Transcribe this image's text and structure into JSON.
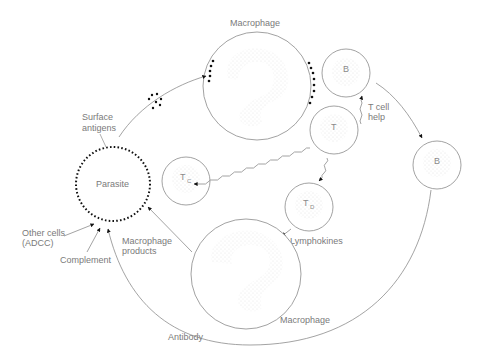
{
  "diagram": {
    "colors": {
      "line": "#8c8c8c",
      "cell_outline": "#8a8a8a",
      "cell_fill": "#f3f3f3",
      "antigen": "#111111",
      "text": "#7a7a7a",
      "background": "#ffffff"
    },
    "nodes": {
      "parasite": {
        "label": "Parasite"
      },
      "macrophage_top": {
        "label": "Macrophage"
      },
      "macrophage_bottom": {
        "label": "Macrophage"
      },
      "b_cell_small": {
        "label": "B"
      },
      "b_cell_right": {
        "label": "B"
      },
      "t_cell": {
        "label": "T"
      },
      "tc_cell": {
        "label": "T",
        "subscript": "C"
      },
      "td_cell": {
        "label": "T",
        "subscript": "D"
      }
    },
    "labels": {
      "surface_antigens_line1": "Surface",
      "surface_antigens_line2": "antigens",
      "t_cell_help_line1": "T cell",
      "t_cell_help_line2": "help",
      "lymphokines": "Lymphokines",
      "macrophage_products_line1": "Macrophage",
      "macrophage_products_line2": "products",
      "other_cells_line1": "Other cells",
      "other_cells_line2": "(ADCC)",
      "complement": "Complement",
      "antibody": "Antibody"
    },
    "edges": [
      {
        "from": "parasite",
        "to": "macrophage_top",
        "label": "Surface antigens",
        "style": "curved-arrow"
      },
      {
        "from": "b_cell_small",
        "to": "b_cell_right",
        "style": "curved-arrow"
      },
      {
        "from": "t_cell",
        "to": "b_cell_small",
        "label": "T cell help",
        "style": "wavy-arrow"
      },
      {
        "from": "t_cell",
        "to": "tc_cell",
        "style": "wavy-arrow"
      },
      {
        "from": "t_cell",
        "to": "td_cell",
        "style": "wavy-arrow"
      },
      {
        "from": "td_cell",
        "to": "macrophage_bottom",
        "label": "Lymphokines",
        "style": "arrow"
      },
      {
        "from": "macrophage_bottom",
        "to": "parasite",
        "label": "Macrophage products",
        "style": "arrow"
      },
      {
        "from": "b_cell_right",
        "to": "parasite",
        "label": "Antibody",
        "style": "curved-arrow"
      },
      {
        "from": "complement",
        "to": "parasite",
        "label": "Complement",
        "style": "arrow"
      },
      {
        "from": "other_cells",
        "to": "parasite",
        "label": "Other cells (ADCC)",
        "style": "arrow"
      }
    ]
  }
}
